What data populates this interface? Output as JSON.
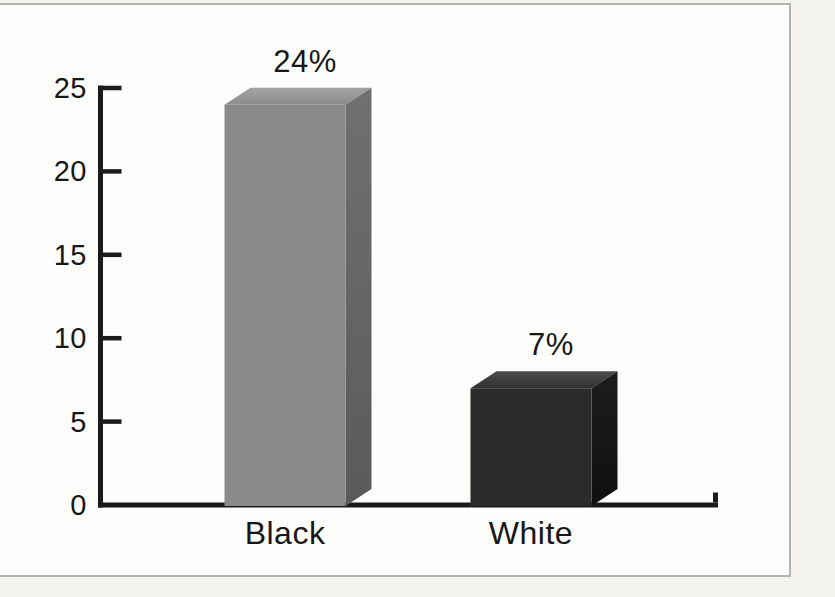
{
  "chart_data": {
    "type": "bar",
    "style": "3d",
    "title": "",
    "xlabel": "",
    "ylabel": "",
    "categories": [
      "Black",
      "White"
    ],
    "values": [
      24,
      7
    ],
    "value_labels": [
      "24%",
      "7%"
    ],
    "y_ticks": [
      0,
      5,
      10,
      15,
      20,
      25
    ],
    "ylim": [
      0,
      25
    ],
    "grid": false,
    "legend": "none",
    "axis_color": "#1b1b1b",
    "text_color": "#171717",
    "bar_colors": [
      {
        "front": "#8a8a8a",
        "top_back": "#a3a3a3",
        "top_front": "#8d8d8d",
        "side_top": "#707070",
        "side_bottom": "#5a5a5a"
      },
      {
        "front": "#2b2b2b",
        "top_back": "#4d4d4d",
        "top_front": "#303030",
        "side_top": "#1d1d1d",
        "side_bottom": "#0f0f0f"
      }
    ]
  },
  "page": {
    "background": "#f4f3ee",
    "panel_background": "#fdfdfb",
    "frame_border": "#b3b3b0"
  }
}
